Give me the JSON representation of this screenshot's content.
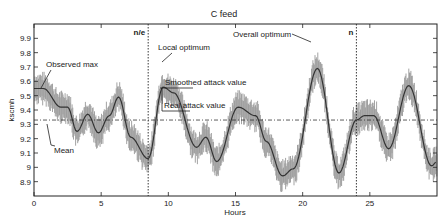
{
  "chart_data": {
    "type": "line",
    "title": "C feed",
    "xlabel": "Hours",
    "ylabel": "kscmh",
    "xlim": [
      0,
      30
    ],
    "ylim": [
      8.8,
      10.0
    ],
    "xticks": [
      0,
      5,
      10,
      15,
      20,
      25
    ],
    "yticks": [
      8.9,
      9.0,
      9.1,
      9.2,
      9.3,
      9.4,
      9.5,
      9.6,
      9.7,
      9.8,
      9.9
    ],
    "ytick_labels": [
      "8.9",
      "9",
      "9.1",
      "9.2",
      "9.3",
      "9.4",
      "9.5",
      "9.6",
      "9.7",
      "9.8",
      "9.9"
    ],
    "grid": false,
    "series": [
      {
        "name": "Smoothed",
        "color": "#333333",
        "x": [
          0,
          0.7,
          2.0,
          2.5,
          3.2,
          4.0,
          4.8,
          5.6,
          6.3,
          7.2,
          8.5,
          9.6,
          10.4,
          12.1,
          12.8,
          13.6,
          15.2,
          16.5,
          17.3,
          18.5,
          19.3,
          21.1,
          22.7,
          24.0,
          24.6,
          25.3,
          26.4,
          27.9,
          29.6,
          30.0
        ],
        "y": [
          9.55,
          9.55,
          9.42,
          9.42,
          9.25,
          9.37,
          9.24,
          9.36,
          9.49,
          9.21,
          9.06,
          9.56,
          9.52,
          9.14,
          9.21,
          9.04,
          9.42,
          9.36,
          9.18,
          8.94,
          8.99,
          9.69,
          8.96,
          9.33,
          9.36,
          9.36,
          9.13,
          9.57,
          9.01,
          9.04
        ]
      },
      {
        "name": "Raw (noisy band)",
        "color": "#999999",
        "band_half_width": 0.12
      }
    ],
    "mean_line": {
      "value": 9.33,
      "style": "dash-dot"
    },
    "vertical_lines": [
      {
        "x": 8.5,
        "label": "n/e",
        "style": "dotted"
      },
      {
        "x": 24.0,
        "label": "n",
        "style": "dotted"
      }
    ],
    "annotations": [
      {
        "text": "Observed max",
        "x": 0.5,
        "y": 9.55
      },
      {
        "text": "Mean",
        "x": 1.0,
        "y": 9.33
      },
      {
        "text": "Local optimum",
        "x": 9.6,
        "y": 9.73
      },
      {
        "text": "Smoothed attack value",
        "x": 9.6,
        "y": 9.56
      },
      {
        "text": "Real attack value",
        "x": 9.6,
        "y": 9.39
      },
      {
        "text": "Overall optimum",
        "x": 20.8,
        "y": 9.87
      }
    ]
  }
}
